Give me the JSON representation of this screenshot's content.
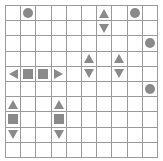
{
  "puzzle": {
    "type": "battleship",
    "rows": 10,
    "cols": 10,
    "colors": {
      "grid": "#9a9a9a",
      "piece": "#8a8a8a",
      "background": "#ffffff"
    },
    "pieces": [
      {
        "row": 0,
        "col": 1,
        "shape": "circle"
      },
      {
        "row": 0,
        "col": 6,
        "shape": "up"
      },
      {
        "row": 0,
        "col": 8,
        "shape": "circle"
      },
      {
        "row": 1,
        "col": 6,
        "shape": "down"
      },
      {
        "row": 2,
        "col": 9,
        "shape": "circle"
      },
      {
        "row": 3,
        "col": 5,
        "shape": "up"
      },
      {
        "row": 3,
        "col": 7,
        "shape": "up"
      },
      {
        "row": 4,
        "col": 0,
        "shape": "left"
      },
      {
        "row": 4,
        "col": 1,
        "shape": "square"
      },
      {
        "row": 4,
        "col": 2,
        "shape": "square"
      },
      {
        "row": 4,
        "col": 3,
        "shape": "right"
      },
      {
        "row": 4,
        "col": 5,
        "shape": "down"
      },
      {
        "row": 4,
        "col": 7,
        "shape": "down"
      },
      {
        "row": 5,
        "col": 9,
        "shape": "circle"
      },
      {
        "row": 6,
        "col": 0,
        "shape": "up"
      },
      {
        "row": 6,
        "col": 3,
        "shape": "up"
      },
      {
        "row": 7,
        "col": 0,
        "shape": "square"
      },
      {
        "row": 7,
        "col": 3,
        "shape": "square"
      },
      {
        "row": 8,
        "col": 0,
        "shape": "down"
      },
      {
        "row": 8,
        "col": 3,
        "shape": "down"
      }
    ]
  }
}
